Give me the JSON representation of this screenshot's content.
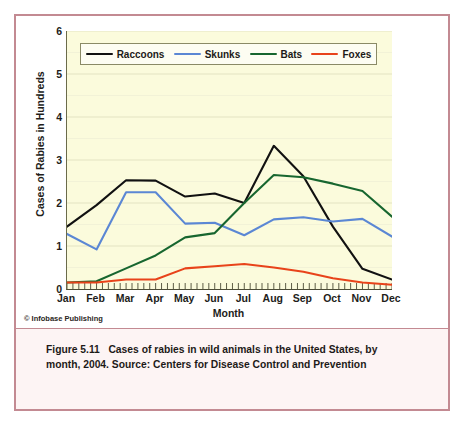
{
  "figure": {
    "credit": "© Infobase Publishing",
    "caption_lead": "Figure 5.11",
    "caption_body": "Cases of rabies in wild animals in the United States, by month, 2004. Source: Centers for Disease Control and Prevention"
  },
  "colors": {
    "raccoons": "#111111",
    "skunks": "#5b87d4",
    "bats": "#17662f",
    "foxes": "#e8431a",
    "plot_background": "#fbfbdc",
    "gridline": "#e3e3c2",
    "frame_border": "#c38a92",
    "caption_background": "#fdf4f4",
    "axis": "#4c4c36"
  },
  "chart_data": {
    "type": "line",
    "title": "",
    "xlabel": "Month",
    "ylabel": "Cases of Rabies in Hundreds",
    "categories": [
      "Jan",
      "Feb",
      "Mar",
      "Apr",
      "May",
      "Jun",
      "Jul",
      "Aug",
      "Sep",
      "Oct",
      "Nov",
      "Dec"
    ],
    "ylim": [
      0,
      6
    ],
    "yticks": [
      0,
      1,
      2,
      3,
      4,
      5,
      6
    ],
    "ytick_labels": [
      "0",
      "1",
      "2",
      "3",
      "4",
      "5",
      "6"
    ],
    "grid": true,
    "grid_axis": "y",
    "minor_xticks_per_interval": 4,
    "legend_position": "top-inside",
    "series": [
      {
        "name": "Raccoons",
        "color": "#111111",
        "values": [
          1.45,
          1.95,
          2.53,
          2.52,
          2.15,
          2.22,
          2.0,
          3.33,
          2.62,
          1.45,
          0.47,
          0.22
        ]
      },
      {
        "name": "Skunks",
        "color": "#5b87d4",
        "values": [
          1.28,
          0.92,
          2.25,
          2.25,
          1.52,
          1.54,
          1.25,
          1.62,
          1.67,
          1.57,
          1.63,
          1.22
        ]
      },
      {
        "name": "Bats",
        "color": "#17662f",
        "values": [
          0.15,
          0.18,
          0.48,
          0.78,
          1.2,
          1.3,
          2.0,
          2.65,
          2.6,
          2.45,
          2.28,
          1.68
        ]
      },
      {
        "name": "Foxes",
        "color": "#e8431a",
        "values": [
          0.15,
          0.15,
          0.22,
          0.22,
          0.48,
          0.53,
          0.58,
          0.5,
          0.4,
          0.25,
          0.15,
          0.1
        ]
      }
    ]
  }
}
